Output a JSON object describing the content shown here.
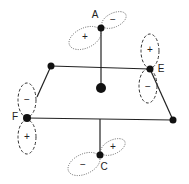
{
  "diagram": {
    "type": "octahedral complex orbital diagram",
    "atoms": {
      "A": {
        "label": "A",
        "x": 101,
        "y": 28
      },
      "E": {
        "label": "E",
        "x": 150,
        "y": 69
      },
      "F": {
        "label": "F",
        "x": 27,
        "y": 118
      },
      "C": {
        "label": "C",
        "x": 100,
        "y": 155
      },
      "top_left": {
        "x": 51,
        "y": 66
      },
      "right": {
        "x": 173,
        "y": 120
      },
      "center": {
        "x": 101,
        "y": 88
      }
    },
    "orbitals": {
      "A": {
        "lobe1_sign": "+",
        "lobe2_sign": "−",
        "style": "dotted"
      },
      "E": {
        "lobe1_sign": "+",
        "lobe2_sign": "−",
        "style": "dashed"
      },
      "F": {
        "lobe1_sign": "−",
        "lobe2_sign": "+",
        "style": "dashed"
      },
      "C": {
        "lobe1_sign": "+",
        "lobe2_sign": "−",
        "style": "dotted"
      }
    }
  }
}
